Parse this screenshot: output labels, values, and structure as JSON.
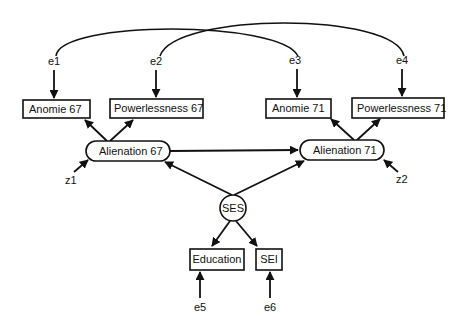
{
  "diagram": {
    "type": "structural-equation-model",
    "observed": {
      "anomie67": "Anomie  67",
      "powerlessness67": "Powerlessness  67",
      "anomie71": "Anomie  71",
      "powerlessness71": "Powerlessness  71",
      "education": "Education",
      "sei": "SEI"
    },
    "latent": {
      "alienation67": "Alienation  67",
      "alienation71": "Alienation  71",
      "ses": "SES"
    },
    "errors": {
      "e1": "e1",
      "e2": "e2",
      "e3": "e3",
      "e4": "e4",
      "e5": "e5",
      "e6": "e6",
      "z1": "z1",
      "z2": "z2"
    },
    "paths": [
      {
        "from": "e1",
        "to": "Anomie 67"
      },
      {
        "from": "e2",
        "to": "Powerlessness 67"
      },
      {
        "from": "e3",
        "to": "Anomie 71"
      },
      {
        "from": "e4",
        "to": "Powerlessness 71"
      },
      {
        "from": "Alienation 67",
        "to": "Anomie 67"
      },
      {
        "from": "Alienation 67",
        "to": "Powerlessness 67"
      },
      {
        "from": "Alienation 71",
        "to": "Anomie 71"
      },
      {
        "from": "Alienation 71",
        "to": "Powerlessness 71"
      },
      {
        "from": "Alienation 67",
        "to": "Alienation 71"
      },
      {
        "from": "SES",
        "to": "Alienation 67"
      },
      {
        "from": "SES",
        "to": "Alienation 71"
      },
      {
        "from": "SES",
        "to": "Education"
      },
      {
        "from": "SES",
        "to": "SEI"
      },
      {
        "from": "e5",
        "to": "Education"
      },
      {
        "from": "e6",
        "to": "SEI"
      },
      {
        "from": "z1",
        "to": "Alienation 67"
      },
      {
        "from": "z2",
        "to": "Alienation 71"
      }
    ],
    "covariances": [
      {
        "between": [
          "e1",
          "e3"
        ]
      },
      {
        "between": [
          "e2",
          "e4"
        ]
      }
    ]
  }
}
